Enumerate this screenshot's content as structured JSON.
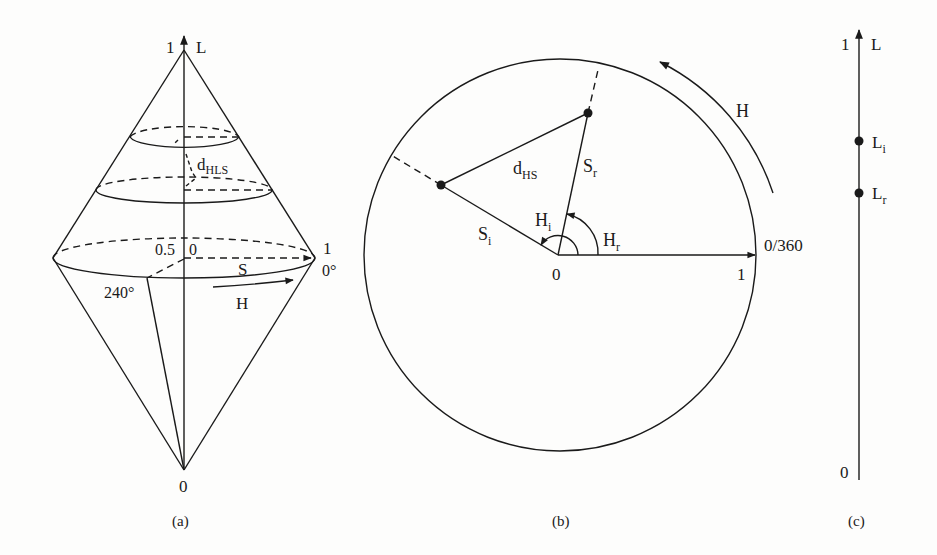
{
  "figure": {
    "panel_a": {
      "caption": "(a)",
      "axis_label": "L",
      "axis_top_value": "1",
      "axis_bottom_value": "0",
      "center_label_s": "0.5",
      "center_label_zero": "0",
      "rim_value": "1",
      "rim_angle": "0°",
      "angle_240": "240°",
      "saturation_label": "S",
      "hue_label": "H",
      "distance_label_main": "d",
      "distance_label_sub": "HLS"
    },
    "panel_b": {
      "caption": "(b)",
      "hue_label": "H",
      "origin_label": "0",
      "radius_label": "1",
      "angle_label": "0/360",
      "distance_label_main": "d",
      "distance_label_sub": "HS",
      "s_i_main": "S",
      "s_i_sub": "i",
      "s_r_main": "S",
      "s_r_sub": "r",
      "h_i_main": "H",
      "h_i_sub": "i",
      "h_r_main": "H",
      "h_r_sub": "r"
    },
    "panel_c": {
      "caption": "(c)",
      "axis_label": "L",
      "axis_top_value": "1",
      "axis_bottom_value": "0",
      "l_i_main": "L",
      "l_i_sub": "i",
      "l_r_main": "L",
      "l_r_sub": "r"
    }
  },
  "colors": {
    "ink": "#1a1a1a",
    "paper": "#fdfdfc"
  }
}
